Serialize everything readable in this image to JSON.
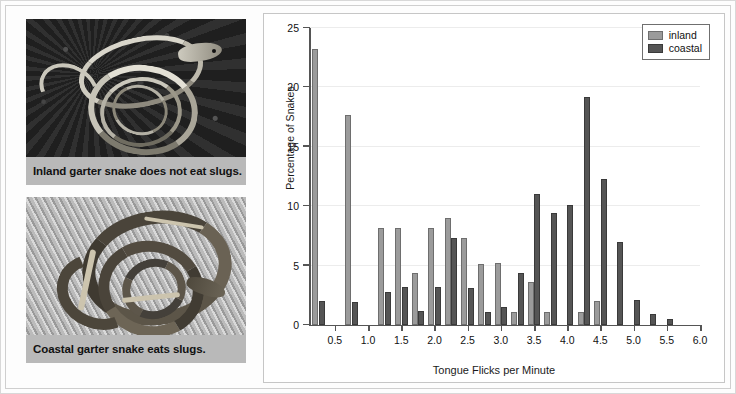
{
  "figure": {
    "background_color": "#fdfdfd",
    "border_color": "#cfcfcf"
  },
  "photos": [
    {
      "name": "inland-garter-snake",
      "caption": "Inland garter snake does not eat slugs.",
      "caption_bg": "#b9b9b9"
    },
    {
      "name": "coastal-garter-snake",
      "caption": "Coastal garter snake eats slugs.",
      "caption_bg": "#b9b9b9"
    }
  ],
  "chart_data": {
    "type": "bar",
    "title": "",
    "xlabel": "Tongue Flicks per Minute",
    "ylabel": "Percentage of Snakes",
    "xlim": [
      0.125,
      6.0
    ],
    "ylim": [
      0,
      25
    ],
    "xticks": [
      "0.5",
      "1.0",
      "1.5",
      "2.0",
      "2.5",
      "3.0",
      "3.5",
      "4.0",
      "4.5",
      "5.0",
      "5.5",
      "6.0"
    ],
    "xtick_values": [
      0.5,
      1.0,
      1.5,
      2.0,
      2.5,
      3.0,
      3.5,
      4.0,
      4.5,
      5.0,
      5.5,
      6.0
    ],
    "yticks": [
      "0",
      "5",
      "10",
      "15",
      "20",
      "25"
    ],
    "ytick_values": [
      0,
      5,
      10,
      15,
      20,
      25
    ],
    "grid": "horizontal",
    "legend_position": "top-right",
    "colors": {
      "inland": "#9b9b9b",
      "coastal": "#555555"
    },
    "x": [
      0.25,
      0.75,
      1.25,
      1.5,
      1.75,
      2.0,
      2.25,
      2.5,
      2.75,
      3.0,
      3.25,
      3.5,
      3.75,
      4.0,
      4.25,
      4.5,
      4.75,
      5.0,
      5.25,
      5.5
    ],
    "series": [
      {
        "name": "inland",
        "values": [
          23.2,
          17.7,
          8.2,
          8.2,
          4.4,
          8.2,
          9.0,
          7.3,
          5.1,
          5.2,
          1.1,
          3.6,
          1.1,
          0,
          1.1,
          2.0,
          0,
          0,
          0,
          0
        ]
      },
      {
        "name": "coastal",
        "values": [
          2.0,
          1.9,
          2.8,
          3.2,
          1.2,
          3.2,
          7.3,
          3.1,
          1.1,
          1.5,
          4.4,
          11.0,
          9.4,
          10.1,
          19.2,
          12.3,
          7.0,
          2.1,
          0.9,
          0.5
        ]
      }
    ],
    "legend": [
      {
        "label": "inland"
      },
      {
        "label": "coastal"
      }
    ]
  }
}
